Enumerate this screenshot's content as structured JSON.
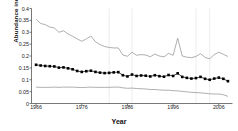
{
  "figure": {
    "xlabel": "Year",
    "ylabel": "Abundance index"
  },
  "chart_data": {
    "type": "line",
    "title": "",
    "xlabel": "Year",
    "ylabel": "Abundance index",
    "xlim": [
      1965,
      2009
    ],
    "ylim": [
      0,
      0.4
    ],
    "xticks": [
      1966,
      1976,
      1986,
      1996,
      2006
    ],
    "yticks": [
      0,
      0.05,
      0.1,
      0.15,
      0.2,
      0.25,
      0.3,
      0.35,
      0.4
    ],
    "ytick_labels": [
      "0",
      "0.05",
      "0.1",
      "0.15",
      "0.2",
      "0.25",
      "0.3",
      "0.35",
      "0.4"
    ],
    "xtick_labels": [
      "1966",
      "1976",
      "1986",
      "1996",
      "2006"
    ],
    "grid": "vertical-only-faint",
    "legend": "none",
    "gridlines_x": [
      1982,
      1987,
      2001,
      2004
    ],
    "colors": {
      "index_line": "#1a1a1a",
      "marker": "#000000",
      "bound_line": "#8c8c8c",
      "axis": "#555555",
      "grid": "#e8e8e8"
    },
    "x": [
      1966,
      1967,
      1968,
      1969,
      1970,
      1971,
      1972,
      1973,
      1974,
      1975,
      1976,
      1977,
      1978,
      1979,
      1980,
      1981,
      1982,
      1983,
      1984,
      1985,
      1986,
      1987,
      1988,
      1989,
      1990,
      1991,
      1992,
      1993,
      1994,
      1995,
      1996,
      1997,
      1998,
      1999,
      2000,
      2001,
      2002,
      2003,
      2004,
      2005,
      2006,
      2007,
      2008
    ],
    "series": [
      {
        "name": "Upper confidence limit",
        "style": "thin-line",
        "marker": "none",
        "values": [
          0.355,
          0.337,
          0.332,
          0.322,
          0.318,
          0.3,
          0.306,
          0.293,
          0.283,
          0.272,
          0.262,
          0.272,
          0.284,
          0.26,
          0.248,
          0.24,
          0.236,
          0.234,
          0.234,
          0.204,
          0.199,
          0.216,
          0.203,
          0.206,
          0.204,
          0.197,
          0.208,
          0.2,
          0.196,
          0.211,
          0.203,
          0.275,
          0.2,
          0.195,
          0.193,
          0.198,
          0.21,
          0.194,
          0.188,
          0.206,
          0.216,
          0.207,
          0.198
        ]
      },
      {
        "name": "Abundance index",
        "style": "line-with-markers",
        "marker": "square",
        "values": [
          0.163,
          0.16,
          0.158,
          0.157,
          0.156,
          0.151,
          0.152,
          0.148,
          0.144,
          0.137,
          0.133,
          0.136,
          0.138,
          0.133,
          0.13,
          0.128,
          0.129,
          0.131,
          0.132,
          0.119,
          0.114,
          0.122,
          0.116,
          0.118,
          0.117,
          0.114,
          0.119,
          0.115,
          0.113,
          0.12,
          0.116,
          0.127,
          0.112,
          0.108,
          0.105,
          0.107,
          0.112,
          0.104,
          0.1,
          0.105,
          0.109,
          0.104,
          0.094
        ]
      },
      {
        "name": "Lower confidence limit",
        "style": "thin-line",
        "marker": "none",
        "values": [
          0.069,
          0.068,
          0.068,
          0.068,
          0.069,
          0.068,
          0.069,
          0.069,
          0.069,
          0.068,
          0.067,
          0.068,
          0.069,
          0.068,
          0.068,
          0.068,
          0.068,
          0.069,
          0.069,
          0.066,
          0.064,
          0.065,
          0.063,
          0.062,
          0.061,
          0.059,
          0.059,
          0.057,
          0.056,
          0.056,
          0.054,
          0.053,
          0.051,
          0.049,
          0.047,
          0.046,
          0.045,
          0.043,
          0.041,
          0.04,
          0.04,
          0.037,
          0.03
        ]
      }
    ]
  }
}
